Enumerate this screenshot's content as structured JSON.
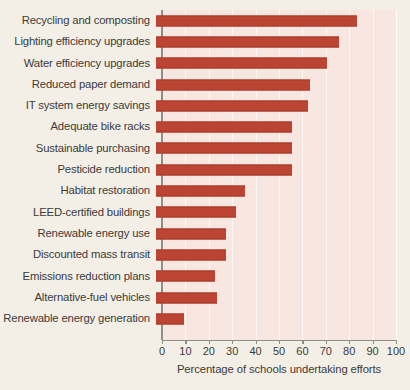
{
  "chart_data": {
    "type": "bar",
    "orientation": "horizontal",
    "title": "",
    "subtitle": "",
    "xlabel": "Percentage of schools undertaking efforts",
    "ylabel": "",
    "xlim": [
      0,
      100
    ],
    "xticks": [
      0,
      10,
      20,
      30,
      40,
      50,
      60,
      70,
      80,
      90,
      100
    ],
    "xtick_labels": [
      "0",
      "10",
      "20",
      "30",
      "40",
      "50",
      "60",
      "70",
      "80",
      "90",
      "100"
    ],
    "grid": "vertical-minor-white",
    "legend": "none",
    "bar_color": "#bb4433",
    "plot_background": "#f7e7e0",
    "page_background": "#f4efe6",
    "categories": [
      "Recycling and composting",
      "Lighting efficiency upgrades",
      "Water efficiency upgrades",
      "Reduced paper demand",
      "IT system energy savings",
      "Adequate bike racks",
      "Sustainable purchasing",
      "Pesticide reduction",
      "Habitat restoration",
      "LEED-certified buildings",
      "Renewable energy use",
      "Discounted mass transit",
      "Emissions reduction plans",
      "Alternative-fuel vehicles",
      "Renewable energy generation"
    ],
    "values": [
      86,
      78,
      73,
      66,
      65,
      58,
      58,
      58,
      38,
      34,
      30,
      30,
      25,
      26,
      12
    ]
  }
}
